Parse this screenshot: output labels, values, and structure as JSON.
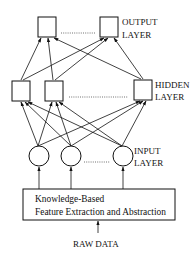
{
  "diagram": {
    "type": "neural-network-architecture",
    "layers": {
      "output": {
        "label_line1": "OUTPUT",
        "label_line2": "LAYER",
        "node_shape": "square",
        "visible_nodes": 2,
        "ellipsis": true
      },
      "hidden": {
        "label_line1": "HIDDEN",
        "label_line2": "LAYER",
        "node_shape": "square",
        "visible_nodes": 3,
        "ellipsis": true
      },
      "input": {
        "label_line1": "INPUT",
        "label_line2": "LAYER",
        "node_shape": "circle",
        "visible_nodes": 3,
        "ellipsis": true
      }
    },
    "preprocessing_box": {
      "line1": "Knowledge-Based",
      "line2": "Feature Extraction and Abstraction"
    },
    "source_label": "RAW DATA",
    "connections": "fully-connected input->hidden and hidden->output, arrows pointing upward",
    "colors": {
      "stroke": "#111111",
      "background": "#ffffff"
    }
  }
}
